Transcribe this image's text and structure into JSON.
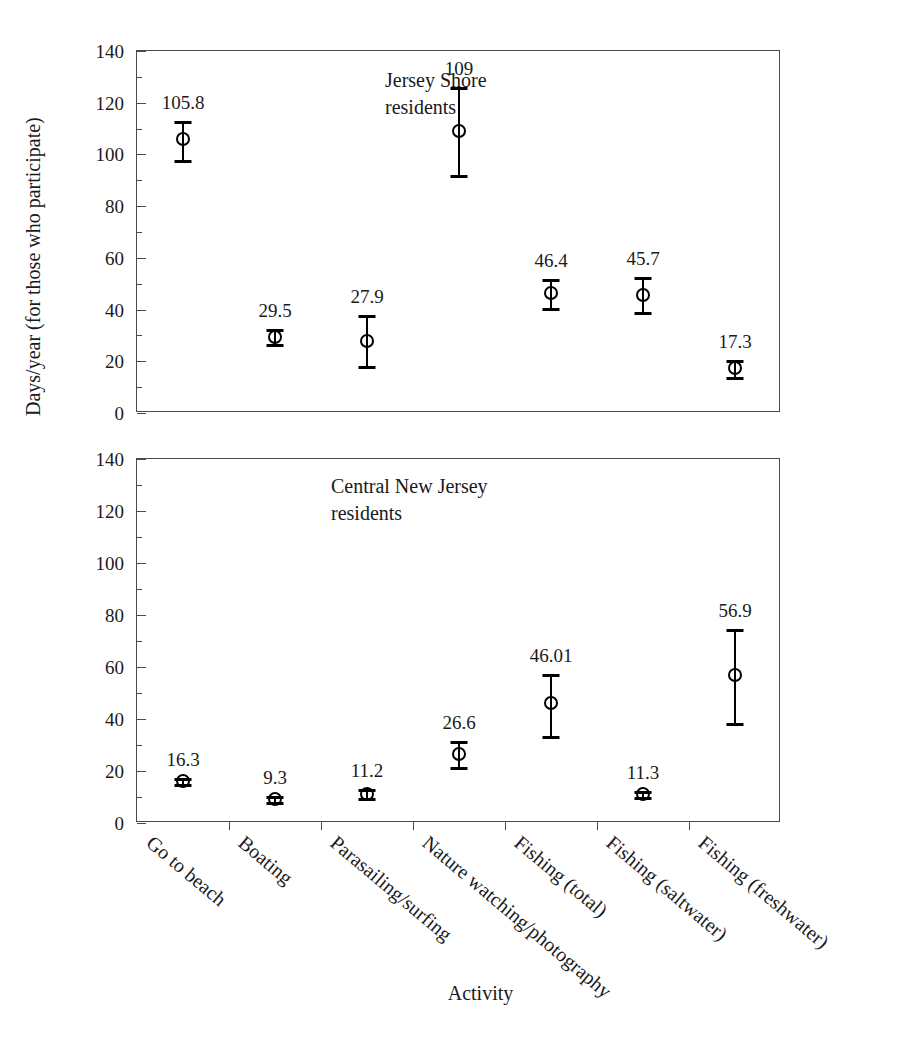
{
  "chart_data": {
    "type": "scatter",
    "title": "",
    "xlabel": "Activity",
    "ylabel": "Days/year (for those who participate)",
    "ylim": [
      0,
      140
    ],
    "ytick_step": 20,
    "yminor_step": 10,
    "grid": false,
    "legend_position": "inside-panel-annotation",
    "categories": [
      "Go to beach",
      "Boating",
      "Parasailing/surfing",
      "Nature watching/photography",
      "Fishing (total)",
      "Fishing (saltwater)",
      "Fishing (freshwater)"
    ],
    "ytick_labels": [
      "0",
      "20",
      "40",
      "60",
      "80",
      "100",
      "120",
      "140"
    ],
    "panels": [
      {
        "annotation": "Jersey Shore\nresidents",
        "series": [
          {
            "name": "Jersey Shore residents",
            "values": [
              105.8,
              29.5,
              27.9,
              109,
              46.4,
              45.7,
              17.3
            ],
            "value_labels": [
              "105.8",
              "29.5",
              "27.9",
              "109",
              "46.4",
              "45.7",
              "17.3"
            ],
            "err_low": [
              98,
              26.5,
              18,
              92,
              40.5,
              39,
              14
            ],
            "err_high": [
              113,
              32.5,
              38,
              126,
              52,
              52.5,
              20.5
            ]
          }
        ]
      },
      {
        "annotation": "Central New Jersey\nresidents",
        "series": [
          {
            "name": "Central New Jersey residents",
            "values": [
              16.3,
              9.3,
              11.2,
              26.6,
              46.01,
              11.3,
              56.9
            ],
            "value_labels": [
              "16.3",
              "9.3",
              "11.2",
              "26.6",
              "46.01",
              "11.3",
              "56.9"
            ],
            "err_low": [
              15,
              8,
              9.5,
              21.5,
              33.5,
              10,
              38.5
            ],
            "err_high": [
              17.5,
              10.5,
              13,
              31.5,
              57.5,
              12.5,
              74.5
            ]
          }
        ]
      }
    ]
  }
}
